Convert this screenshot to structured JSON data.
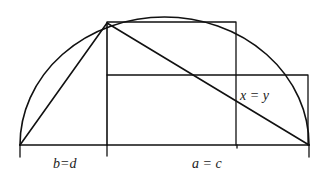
{
  "diagram": {
    "type": "geometric-construction",
    "colors": {
      "stroke": "#111111",
      "text": "#222222",
      "background": "#ffffff"
    },
    "labels": {
      "left_segment": "b=d",
      "right_segment": "a = c",
      "intersection": "x = y"
    },
    "points": {
      "left_end": [
        20,
        145
      ],
      "foot": [
        107,
        145
      ],
      "apex": [
        107,
        23
      ],
      "right_end": [
        309,
        145
      ],
      "upper_rect_corner": [
        236,
        22
      ],
      "lower_rect_corner": [
        308,
        75
      ]
    }
  }
}
